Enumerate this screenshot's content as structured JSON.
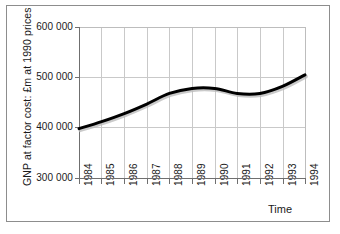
{
  "chart_data": {
    "type": "line",
    "title": "",
    "xlabel": "Time",
    "ylabel": "GNP at factor cost: £m at 1990 prices",
    "x": [
      1984,
      1985,
      1986,
      1987,
      1988,
      1989,
      1990,
      1991,
      1992,
      1993,
      1994
    ],
    "categories": [
      "1984",
      "1985",
      "1986",
      "1987",
      "1988",
      "1989",
      "1990",
      "1991",
      "1992",
      "1993",
      "1994"
    ],
    "values": [
      398000,
      412000,
      428000,
      447000,
      468000,
      478000,
      478000,
      468000,
      468000,
      482000,
      505000
    ],
    "series": [
      {
        "name": "GNP at factor cost",
        "values": [
          398000,
          412000,
          428000,
          447000,
          468000,
          478000,
          478000,
          468000,
          468000,
          482000,
          505000
        ]
      }
    ],
    "ylim": [
      300000,
      600000
    ],
    "xlim": [
      1984,
      1994
    ],
    "yticks": [
      300000,
      400000,
      500000,
      600000
    ],
    "ytick_labels": [
      "300 000",
      "400 000",
      "500 000",
      "600 000"
    ],
    "xtick_labels": [
      "1984",
      "1985",
      "1986",
      "1987",
      "1988",
      "1989",
      "1990",
      "1991",
      "1992",
      "1993",
      "1994"
    ],
    "grid": true,
    "legend": false,
    "legend_position": "none",
    "line_color": "#000000",
    "grid_color": "#c9c9c9",
    "axis_color": "#6f6f6f",
    "background_color": "#ffffff",
    "frame_color": "#8d8d8d",
    "line_width": 3
  }
}
